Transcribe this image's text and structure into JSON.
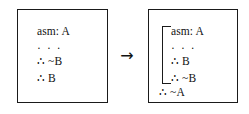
{
  "figure": {
    "arrow_glyph": "→",
    "arrow_name": "rightwards-arrow"
  },
  "left_box": {
    "label": "before-subproof",
    "lines": [
      {
        "text": "asm: A",
        "kind": "assumption"
      },
      {
        "text": "· · ·",
        "kind": "ellipsis"
      },
      {
        "text": "∴ ~B",
        "kind": "derived"
      },
      {
        "text": "∴ B",
        "kind": "derived"
      }
    ]
  },
  "right_box": {
    "label": "after-subproof",
    "scoped_lines": [
      {
        "text": "asm: A",
        "kind": "assumption"
      },
      {
        "text": "· · ·",
        "kind": "ellipsis"
      },
      {
        "text": "∴ B",
        "kind": "derived"
      },
      {
        "text": "∴ ~B",
        "kind": "derived"
      }
    ],
    "discharged_lines": [
      {
        "text": "∴ ~A",
        "kind": "conclusion"
      }
    ]
  },
  "colors": {
    "background": "#ffffff",
    "ink": "#111111",
    "border": "#1a1a1a"
  }
}
